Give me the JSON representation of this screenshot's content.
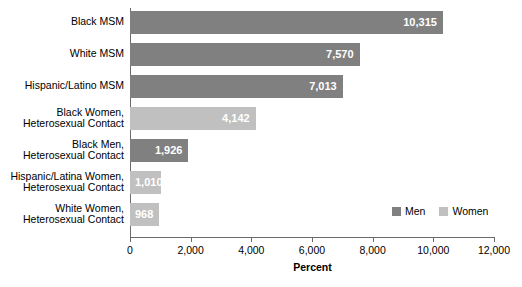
{
  "chart_data": {
    "type": "bar",
    "orientation": "horizontal",
    "title": "",
    "xlabel": "Percent",
    "ylabel": "",
    "xlim": [
      0,
      12000
    ],
    "xticks": [
      0,
      2000,
      4000,
      6000,
      8000,
      10000,
      12000
    ],
    "xtick_labels": [
      "0",
      "2,000",
      "4,000",
      "6,000",
      "8,000",
      "10,000",
      "12,000"
    ],
    "grid": false,
    "legend_position": "bottom-right",
    "categories": [
      "Black MSM",
      "White MSM",
      "Hispanic/Latino MSM",
      "Black Women, Heterosexual Contact",
      "Black Men, Heterosexual Contact",
      "Hispanic/Latina Women, Heterosexual Contact",
      "White Women, Heterosexual Contact"
    ],
    "values": [
      10315,
      7570,
      7013,
      4142,
      1926,
      1010,
      968
    ],
    "value_labels": [
      "10,315",
      "7,570",
      "7,013",
      "4,142",
      "1,926",
      "1,010",
      "968"
    ],
    "series": [
      {
        "name": "Men",
        "color": "#808080"
      },
      {
        "name": "Women",
        "color": "#c0c0c0"
      }
    ],
    "bars": [
      {
        "category_lines": [
          "Black MSM"
        ],
        "value": 10315,
        "value_label": "10,315",
        "series": "Men",
        "color": "#808080",
        "label_position": "inside-right"
      },
      {
        "category_lines": [
          "White MSM"
        ],
        "value": 7570,
        "value_label": "7,570",
        "series": "Men",
        "color": "#808080",
        "label_position": "inside-right"
      },
      {
        "category_lines": [
          "Hispanic/Latino MSM"
        ],
        "value": 7013,
        "value_label": "7,013",
        "series": "Men",
        "color": "#808080",
        "label_position": "inside-right"
      },
      {
        "category_lines": [
          "Black Women,",
          "Heterosexual Contact"
        ],
        "value": 4142,
        "value_label": "4,142",
        "series": "Women",
        "color": "#c0c0c0",
        "label_position": "inside-right"
      },
      {
        "category_lines": [
          "Black Men,",
          "Heterosexual Contact"
        ],
        "value": 1926,
        "value_label": "1,926",
        "series": "Men",
        "color": "#808080",
        "label_position": "inside-right"
      },
      {
        "category_lines": [
          "Hispanic/Latina Women,",
          "Heterosexual Contact"
        ],
        "value": 1010,
        "value_label": "1,010",
        "series": "Women",
        "color": "#c0c0c0",
        "label_position": "inside-left"
      },
      {
        "category_lines": [
          "White Women,",
          "Heterosexual Contact"
        ],
        "value": 968,
        "value_label": "968",
        "series": "Women",
        "color": "#c0c0c0",
        "label_position": "inside-left"
      }
    ],
    "legend": [
      {
        "label": "Men",
        "color": "#808080"
      },
      {
        "label": "Women",
        "color": "#c0c0c0"
      }
    ],
    "axis_color": "#6b6b6b",
    "background": "#ffffff"
  }
}
